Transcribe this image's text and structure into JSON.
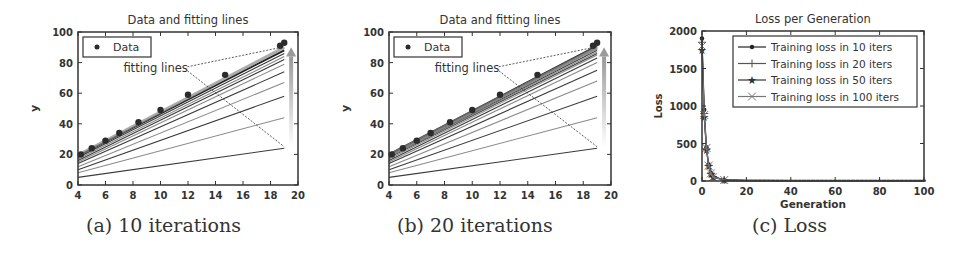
{
  "figures": [
    {
      "caption": "(a) 10 iterations"
    },
    {
      "caption": "(b) 20 iterations"
    },
    {
      "caption": "(c) Loss"
    }
  ],
  "colors": {
    "axis": "#333333",
    "data": "#2b2b2b",
    "line_dark": "#3a3a3a",
    "line_light": "#8a8a8a",
    "arrow": "#9a9a9a"
  },
  "chart_data": [
    {
      "type": "scatter",
      "title": "Data and fitting lines",
      "xlabel": "",
      "ylabel": "y",
      "xlim": [
        4,
        20
      ],
      "ylim": [
        0,
        100
      ],
      "xticks": [
        4,
        6,
        8,
        10,
        12,
        14,
        16,
        18,
        20
      ],
      "yticks": [
        0,
        20,
        40,
        60,
        80,
        100
      ],
      "legend": [
        "Data"
      ],
      "legend_position": "upper left",
      "annotation": "fitting lines",
      "data_points": {
        "x": [
          4.2,
          5.0,
          6.0,
          7.0,
          8.4,
          10.0,
          12.0,
          14.7,
          18.7,
          19.0
        ],
        "y": [
          20,
          24,
          29,
          34,
          41,
          49,
          59,
          72,
          91,
          93
        ]
      },
      "fitting_lines": [
        {
          "y_at_4": 5,
          "y_at_19": 24
        },
        {
          "y_at_4": 8,
          "y_at_19": 44
        },
        {
          "y_at_4": 10,
          "y_at_19": 58
        },
        {
          "y_at_4": 12,
          "y_at_19": 67
        },
        {
          "y_at_4": 14,
          "y_at_19": 74
        },
        {
          "y_at_4": 15,
          "y_at_19": 79
        },
        {
          "y_at_4": 16,
          "y_at_19": 82
        },
        {
          "y_at_4": 17,
          "y_at_19": 84
        },
        {
          "y_at_4": 18,
          "y_at_19": 86
        },
        {
          "y_at_4": 19,
          "y_at_19": 88
        }
      ],
      "grid": false
    },
    {
      "type": "scatter",
      "title": "Data and fitting lines",
      "xlabel": "",
      "ylabel": "y",
      "xlim": [
        4,
        20
      ],
      "ylim": [
        0,
        100
      ],
      "xticks": [
        4,
        6,
        8,
        10,
        12,
        14,
        16,
        18,
        20
      ],
      "yticks": [
        0,
        20,
        40,
        60,
        80,
        100
      ],
      "legend": [
        "Data"
      ],
      "legend_position": "upper left",
      "annotation": "fitting lines",
      "data_points": {
        "x": [
          4.2,
          5.0,
          6.0,
          7.0,
          8.4,
          10.0,
          12.0,
          14.7,
          18.7,
          19.0
        ],
        "y": [
          20,
          24,
          29,
          34,
          41,
          49,
          59,
          72,
          91,
          93
        ]
      },
      "fitting_lines": [
        {
          "y_at_4": 5,
          "y_at_19": 24
        },
        {
          "y_at_4": 8,
          "y_at_19": 44
        },
        {
          "y_at_4": 10,
          "y_at_19": 58
        },
        {
          "y_at_4": 12,
          "y_at_19": 68
        },
        {
          "y_at_4": 14,
          "y_at_19": 75
        },
        {
          "y_at_4": 15,
          "y_at_19": 80
        },
        {
          "y_at_4": 16,
          "y_at_19": 83
        },
        {
          "y_at_4": 17,
          "y_at_19": 85
        },
        {
          "y_at_4": 18,
          "y_at_19": 86
        },
        {
          "y_at_4": 18.5,
          "y_at_19": 87
        },
        {
          "y_at_4": 19,
          "y_at_19": 88
        },
        {
          "y_at_4": 19,
          "y_at_19": 89
        },
        {
          "y_at_4": 19.5,
          "y_at_19": 90
        },
        {
          "y_at_4": 19.5,
          "y_at_19": 90
        },
        {
          "y_at_4": 20,
          "y_at_19": 91
        }
      ],
      "grid": false
    },
    {
      "type": "line",
      "title": "Loss per Generation",
      "xlabel": "Generation",
      "ylabel": "Loss",
      "xlim": [
        0,
        100
      ],
      "ylim": [
        0,
        2000
      ],
      "xticks": [
        0,
        20,
        40,
        60,
        80,
        100
      ],
      "yticks": [
        0,
        500,
        1000,
        1500,
        2000
      ],
      "legend_position": "upper right",
      "series": [
        {
          "name": "Training loss in 10 iters",
          "marker": "dot",
          "x": [
            0,
            1,
            2,
            3,
            4,
            5,
            10,
            20,
            40,
            60,
            80,
            100
          ],
          "y": [
            1900,
            950,
            450,
            220,
            110,
            60,
            15,
            8,
            6,
            5,
            5,
            5
          ]
        },
        {
          "name": "Training loss in 20 iters",
          "marker": "plus",
          "x": [
            0,
            1,
            2,
            3,
            4,
            5,
            10,
            20,
            40,
            60,
            80,
            100
          ],
          "y": [
            1850,
            900,
            430,
            210,
            105,
            55,
            14,
            7,
            5,
            5,
            4,
            4
          ]
        },
        {
          "name": "Training loss in 50 iters",
          "marker": "star",
          "x": [
            0,
            1,
            2,
            3,
            4,
            5,
            10,
            20,
            40,
            60,
            80,
            100
          ],
          "y": [
            1750,
            850,
            420,
            200,
            100,
            50,
            12,
            6,
            4,
            4,
            4,
            4
          ]
        },
        {
          "name": "Training loss in 100 iters",
          "marker": "x",
          "x": [
            0,
            1,
            2,
            3,
            4,
            5,
            10,
            20,
            40,
            60,
            80,
            100
          ],
          "y": [
            1800,
            880,
            440,
            205,
            102,
            52,
            13,
            6,
            4,
            3,
            3,
            3
          ]
        }
      ],
      "grid": false
    }
  ]
}
